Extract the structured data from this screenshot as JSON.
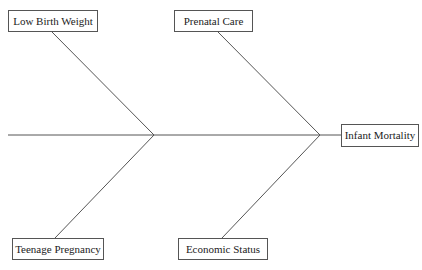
{
  "diagram": {
    "type": "fishbone",
    "effect": "Infant Mortality",
    "causes": [
      {
        "label": "Low Birth Weight",
        "position": "top-left"
      },
      {
        "label": "Prenatal Care",
        "position": "top-right"
      },
      {
        "label": "Teenage Pregnancy",
        "position": "bottom-left"
      },
      {
        "label": "Economic Status",
        "position": "bottom-right"
      }
    ],
    "line_color": "#555555"
  }
}
